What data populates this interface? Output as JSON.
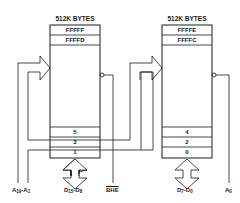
{
  "diagram": {
    "banks": [
      {
        "name": "odd-bank",
        "header": "512K BYTES",
        "top_cells": [
          "FFFFF",
          "FFFFD"
        ],
        "bottom_cells": [
          "5",
          "3",
          "1"
        ],
        "data_bus": {
          "label_main": "D",
          "sub1": "15",
          "sep": "-D",
          "sub2": "8"
        },
        "select": {
          "label": "BHE",
          "active_low": true
        }
      },
      {
        "name": "even-bank",
        "header": "512K BYTES",
        "top_cells": [
          "FFFFE",
          "FFFFC"
        ],
        "bottom_cells": [
          "4",
          "2",
          "0"
        ],
        "data_bus": {
          "label_main": "D",
          "sub1": "7",
          "sep": "-D",
          "sub2": "0"
        },
        "select": {
          "label_main": "A",
          "sub": "0"
        }
      }
    ],
    "address_bus": {
      "label_main": "A",
      "sub1": "19",
      "sep": "-A",
      "sub2": "1"
    },
    "colors": {
      "line": "#1a1a1a",
      "background": "#ffffff"
    }
  }
}
